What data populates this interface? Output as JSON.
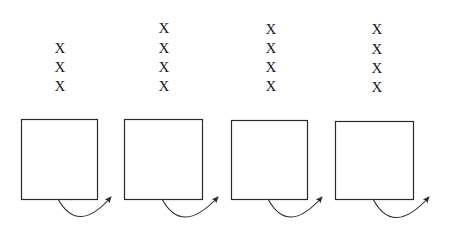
{
  "diagram": {
    "mark_symbol": "X",
    "stroke_color": "#2a2a2a",
    "panels": [
      {
        "name": "panel-1",
        "marks": [
          {
            "x": 60,
            "y": 48
          },
          {
            "x": 60,
            "y": 67
          },
          {
            "x": 60,
            "y": 86
          }
        ],
        "box": {
          "x": 21,
          "y": 119,
          "w": 76,
          "h": 80
        },
        "arrow": {
          "start": [
            58,
            199
          ],
          "ctrl": [
            78,
            235
          ],
          "end": [
            111,
            197
          ]
        }
      },
      {
        "name": "panel-2",
        "marks": [
          {
            "x": 164,
            "y": 28
          },
          {
            "x": 164,
            "y": 48
          },
          {
            "x": 164,
            "y": 67
          },
          {
            "x": 164,
            "y": 86
          }
        ],
        "box": {
          "x": 124,
          "y": 119,
          "w": 78,
          "h": 80
        },
        "arrow": {
          "start": [
            162,
            199
          ],
          "ctrl": [
            182,
            236
          ],
          "end": [
            218,
            197
          ]
        }
      },
      {
        "name": "panel-3",
        "marks": [
          {
            "x": 271,
            "y": 29
          },
          {
            "x": 271,
            "y": 48
          },
          {
            "x": 271,
            "y": 67
          },
          {
            "x": 271,
            "y": 86
          }
        ],
        "box": {
          "x": 231,
          "y": 120,
          "w": 76,
          "h": 79
        },
        "arrow": {
          "start": [
            268,
            199
          ],
          "ctrl": [
            288,
            236
          ],
          "end": [
            322,
            197
          ]
        }
      },
      {
        "name": "panel-4",
        "marks": [
          {
            "x": 377,
            "y": 29
          },
          {
            "x": 377,
            "y": 49
          },
          {
            "x": 377,
            "y": 68
          },
          {
            "x": 377,
            "y": 87
          }
        ],
        "box": {
          "x": 335,
          "y": 121,
          "w": 78,
          "h": 78
        },
        "arrow": {
          "start": [
            373,
            199
          ],
          "ctrl": [
            393,
            237
          ],
          "end": [
            429,
            197
          ]
        }
      }
    ]
  }
}
